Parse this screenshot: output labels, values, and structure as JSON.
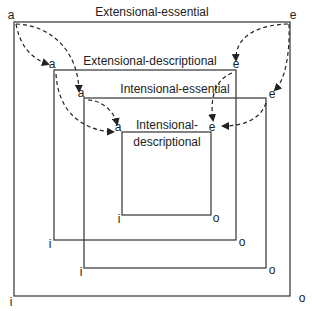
{
  "diagram": {
    "colors": {
      "line": "#333333",
      "text": "#222222",
      "background": "#ffffff"
    },
    "boxes": [
      {
        "id": "extensional-essential",
        "title": "Extensional-essential",
        "corners": {
          "top_left": "a",
          "top_right": "e",
          "bottom_left": "i",
          "bottom_right": "o"
        }
      },
      {
        "id": "extensional-descriptional",
        "title": "Extensional-descriptional",
        "corners": {
          "top_left": "a",
          "top_right": "e",
          "bottom_left": "i",
          "bottom_right": "o"
        }
      },
      {
        "id": "intensional-essential",
        "title": "Intensional-essential",
        "corners": {
          "top_left": "a",
          "top_right": "e",
          "bottom_left": "i",
          "bottom_right": "o"
        }
      },
      {
        "id": "intensional-descriptional",
        "title_line1": "Intensional-",
        "title_line2": "descriptional",
        "corners": {
          "top_left": "a",
          "top_right": "e",
          "bottom_left": "i",
          "bottom_right": "o"
        }
      }
    ],
    "arrows": [
      {
        "from": "extensional-essential.a",
        "to": "extensional-descriptional.a",
        "style": "dashed"
      },
      {
        "from": "extensional-essential.a",
        "to": "intensional-essential.a",
        "style": "dashed"
      },
      {
        "from": "extensional-descriptional.a",
        "to": "intensional-descriptional.a",
        "style": "dashed"
      },
      {
        "from": "intensional-essential.a",
        "to": "intensional-descriptional.a",
        "style": "dashed"
      },
      {
        "from": "extensional-essential.e",
        "to": "extensional-descriptional.e",
        "style": "dashed"
      },
      {
        "from": "extensional-essential.e",
        "to": "intensional-essential.e",
        "style": "dashed"
      },
      {
        "from": "extensional-descriptional.e",
        "to": "intensional-descriptional.e",
        "style": "dashed"
      },
      {
        "from": "intensional-essential.e",
        "to": "intensional-descriptional.e",
        "style": "dashed"
      }
    ]
  }
}
